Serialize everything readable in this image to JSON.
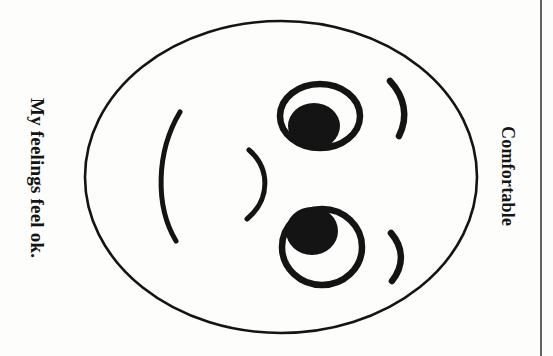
{
  "page": {
    "background_color": "#fdfdfc",
    "ink_color": "#141414",
    "width": 553,
    "height": 356
  },
  "labels": {
    "left": {
      "text": "My feelings feel ok.",
      "orientation": "rotated-90-clockwise",
      "style": "bold serif"
    },
    "right": {
      "text": "Comfortable",
      "orientation": "rotated-90-clockwise",
      "style": "bold serif"
    }
  },
  "drawing": {
    "name": "smiley-face-sideways",
    "face_outline": {
      "shape": "ellipse",
      "cx": 281,
      "cy": 177,
      "rx": 196,
      "ry": 156,
      "stroke_width": 2.6
    },
    "eyes": [
      {
        "name": "eye-upper",
        "ring": {
          "cx": 320,
          "cy": 116,
          "rx": 40,
          "ry": 32,
          "stroke_width": 6
        },
        "pupil": {
          "cx": 314,
          "cy": 126,
          "rx": 26,
          "ry": 23
        }
      },
      {
        "name": "eye-lower",
        "ring": {
          "cx": 322,
          "cy": 247,
          "rx": 40,
          "ry": 38,
          "stroke_width": 6
        },
        "pupil": {
          "cx": 312,
          "cy": 231,
          "rx": 26,
          "ry": 24
        }
      }
    ],
    "eyebrows": [
      {
        "name": "eyebrow-upper",
        "path": "M 390 81 C 404 96 409 116 399 136",
        "stroke_width": 6
      },
      {
        "name": "eyebrow-lower",
        "path": "M 391 233 C 404 248 404 266 392 281",
        "stroke_width": 6
      }
    ],
    "nose": {
      "name": "nose-curve",
      "path": "M 249 150 C 270 168 271 199 247 219",
      "stroke_width": 5
    },
    "mouth": {
      "name": "mouth-curve",
      "path": "M 180 112 C 156 152 155 206 176 241",
      "stroke_width": 5
    }
  },
  "page_edge": {
    "name": "page-edge-line",
    "x": 541,
    "y1": 0,
    "y2": 356,
    "stroke_width": 1.6
  }
}
